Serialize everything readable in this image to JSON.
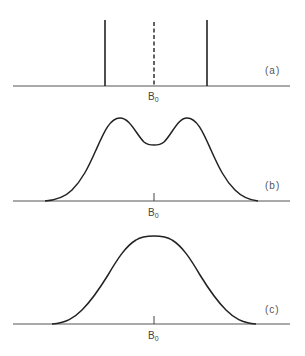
{
  "figure": {
    "panels": [
      {
        "id": "a",
        "label": "(a)",
        "axis_label_main": "B",
        "axis_label_sub": "0",
        "description": "Two sharp resonance lines symmetric about B0 (dashed center line)"
      },
      {
        "id": "b",
        "label": "(b)",
        "axis_label_main": "B",
        "axis_label_sub": "0",
        "description": "Partially resolved doublet: broadened lines with dip at B0"
      },
      {
        "id": "c",
        "label": "(c)",
        "axis_label_main": "B",
        "axis_label_sub": "0",
        "description": "Fully merged single broad line centered at B0"
      }
    ],
    "colors": {
      "line": "#222222",
      "baseline": "#555555",
      "text": "#444444",
      "background": "#ffffff"
    }
  }
}
